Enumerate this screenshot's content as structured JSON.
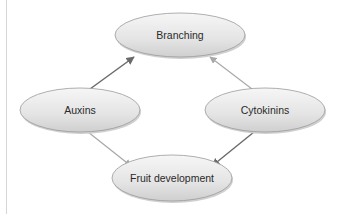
{
  "diagram": {
    "nodes": [
      {
        "id": "branching",
        "label": "Branching",
        "cx": 180,
        "cy": 35,
        "rx": 65,
        "ry": 22
      },
      {
        "id": "auxins",
        "label": "Auxins",
        "cx": 80,
        "cy": 110,
        "rx": 60,
        "ry": 22
      },
      {
        "id": "cytokinins",
        "label": "Cytokinins",
        "cx": 265,
        "cy": 110,
        "rx": 60,
        "ry": 22
      },
      {
        "id": "fruit",
        "label": "Fruit development",
        "cx": 172,
        "cy": 178,
        "rx": 60,
        "ry": 23
      }
    ],
    "edges": [
      {
        "from": "Auxins",
        "to": "Branching",
        "style": "dark"
      },
      {
        "from": "Cytokinins",
        "to": "Branching",
        "style": "light"
      },
      {
        "from": "Auxins",
        "to": "Fruit development",
        "style": "light"
      },
      {
        "from": "Cytokinins",
        "to": "Fruit development",
        "style": "dark"
      }
    ],
    "colors": {
      "node_fill_top": "#f4f4f4",
      "node_fill_bottom": "#d9d9d9",
      "node_stroke": "#9a9a9a",
      "arrow_dark": "#6a6a6a",
      "arrow_light": "#a8a8a8",
      "rule": "#d6d6d6"
    }
  }
}
